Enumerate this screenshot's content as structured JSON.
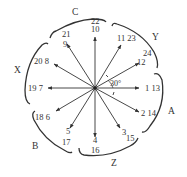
{
  "diagram": {
    "type": "winding phasor star diagram",
    "center": [
      95,
      88
    ],
    "slot_angle": "30°",
    "colors": {
      "line": "#333333",
      "background": "#ffffff"
    },
    "arrows": [
      {
        "angle_deg": 0,
        "label": "1 13",
        "label_pos": [
          137,
          92
        ]
      },
      {
        "angle_deg": -30,
        "label": "2 14",
        "label_pos": [
          134,
          116
        ]
      },
      {
        "angle_deg": -60,
        "label": "3",
        "label_pos": [
          120,
          133
        ]
      },
      {
        "angle_deg": -90,
        "label": "4",
        "label_pos": [
          95,
          141
        ]
      },
      {
        "angle_deg": -120,
        "label": "5",
        "label_pos": [
          66,
          133
        ]
      },
      {
        "angle_deg": -150,
        "label": "18 6",
        "label_pos": [
          35,
          120
        ]
      },
      {
        "angle_deg": 180,
        "label": "19 7",
        "label_pos": [
          28,
          91
        ]
      },
      {
        "angle_deg": 150,
        "label": "20 8",
        "label_pos": [
          34,
          64
        ]
      },
      {
        "angle_deg": 120,
        "label": "9",
        "label_pos": [
          62,
          47
        ]
      },
      {
        "angle_deg": 90,
        "label": "10",
        "label_pos": [
          91,
          31
        ]
      },
      {
        "angle_deg": 60,
        "label": "11 23",
        "label_pos": [
          117,
          41
        ]
      },
      {
        "angle_deg": 30,
        "label": "12",
        "label_pos": [
          136,
          64
        ]
      }
    ],
    "extra_labels": [
      {
        "text": "22",
        "pos": [
          91,
          23
        ]
      },
      {
        "text": "21",
        "pos": [
          62,
          37
        ]
      },
      {
        "text": "24",
        "pos": [
          144,
          57
        ]
      },
      {
        "text": "17",
        "pos": [
          62,
          144
        ]
      },
      {
        "text": "16",
        "pos": [
          91,
          151
        ]
      },
      {
        "text": "15",
        "pos": [
          124,
          140
        ]
      }
    ],
    "angle_annotation": "30°",
    "phase_labels": {
      "A": "A",
      "Y": "Y",
      "C": "C",
      "X": "X",
      "B": "B",
      "Z": "Z"
    }
  }
}
